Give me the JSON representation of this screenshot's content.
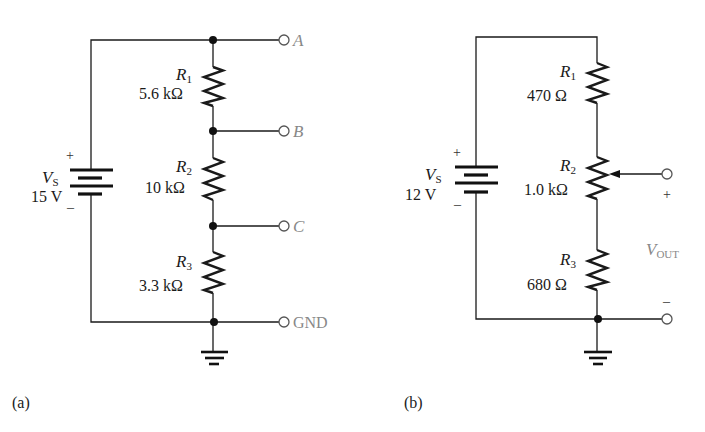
{
  "circuit_a": {
    "caption": "(a)",
    "source": {
      "symbol": "V",
      "subscript": "S",
      "value": "15 V",
      "plus": "+",
      "minus": "–"
    },
    "resistors": [
      {
        "symbol": "R",
        "subscript": "1",
        "value": "5.6 kΩ"
      },
      {
        "symbol": "R",
        "subscript": "2",
        "value": "10 kΩ"
      },
      {
        "symbol": "R",
        "subscript": "3",
        "value": "3.3 kΩ"
      }
    ],
    "terminals": [
      "A",
      "B",
      "C",
      "GND"
    ]
  },
  "circuit_b": {
    "caption": "(b)",
    "source": {
      "symbol": "V",
      "subscript": "S",
      "value": "12 V",
      "plus": "+",
      "minus": "–"
    },
    "resistors": [
      {
        "symbol": "R",
        "subscript": "1",
        "value": "470 Ω"
      },
      {
        "symbol": "R",
        "subscript": "2",
        "value": "1.0 kΩ"
      },
      {
        "symbol": "R",
        "subscript": "3",
        "value": "680 Ω"
      }
    ],
    "output": {
      "symbol": "V",
      "subscript": "OUT",
      "plus": "+",
      "minus": "–"
    }
  },
  "colors": {
    "wire": "#1a1a1a",
    "terminal_label": "#888888"
  }
}
